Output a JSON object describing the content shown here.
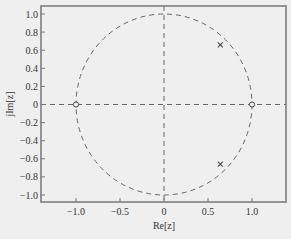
{
  "chart_data": {
    "type": "scatter",
    "title": "",
    "subtitle": "Pole-zero plot (z-plane)",
    "xlabel": "Re[z]",
    "ylabel": "jIm[z]",
    "xlim": [
      -1.4,
      1.4
    ],
    "ylim": [
      -1.1,
      1.1
    ],
    "x_ticks": [
      -1.0,
      -0.5,
      0,
      0.5,
      1.0
    ],
    "x_tick_labels": [
      "−1.0",
      "−0.5",
      "0",
      "0.5",
      "1.0"
    ],
    "y_ticks": [
      1.0,
      0.8,
      0.6,
      0.4,
      0.2,
      0,
      -0.2,
      -0.4,
      -0.6,
      -0.8,
      -1.0
    ],
    "y_tick_labels": [
      "1.0",
      "0.8",
      "0.6",
      "0.4",
      "0.2",
      "0",
      "−0.2",
      "−0.4",
      "−0.6",
      "−0.8",
      "−1.0"
    ],
    "grid": false,
    "legend": null,
    "unit_circle": {
      "center": [
        0,
        0
      ],
      "radius": 1,
      "style": "dashed"
    },
    "axes_lines": {
      "real_axis": "dashed",
      "imag_axis": "dashed"
    },
    "series": [
      {
        "name": "zeros",
        "marker": "o",
        "points": [
          [
            -1.0,
            0
          ],
          [
            1.0,
            0
          ]
        ]
      },
      {
        "name": "poles",
        "marker": "x",
        "points": [
          [
            0.64,
            0.66
          ],
          [
            0.64,
            -0.66
          ]
        ]
      }
    ]
  },
  "colors": {
    "background": "#efefef",
    "axes_frame": "#777777",
    "dash": "#666666",
    "marker": "#444444",
    "text": "#333333"
  }
}
